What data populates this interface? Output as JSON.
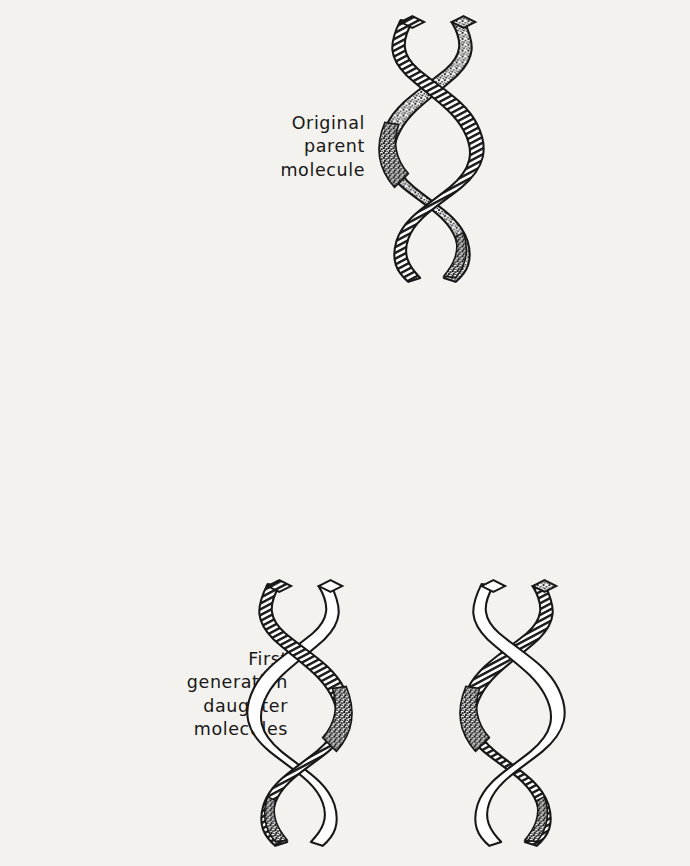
{
  "figure": {
    "background_color": "#f4f2ee",
    "ink_color": "#171717",
    "rows": [
      {
        "id": "parent",
        "label_lines": [
          "Original",
          "parent",
          "molecule"
        ],
        "molecule_count": 1
      },
      {
        "id": "first",
        "label_lines": [
          "First",
          "generation",
          "daughter",
          "molecules"
        ],
        "molecule_count": 2
      },
      {
        "id": "second",
        "label_lines": [
          "Second",
          "generation",
          "daughter",
          "molecules"
        ],
        "molecule_count": 4
      }
    ]
  },
  "labels": {
    "parent": {
      "l1": "Original",
      "l2": "parent",
      "l3": "molecule",
      "l4": ""
    },
    "first": {
      "l1": "First",
      "l2": "generation",
      "l3": "daughter",
      "l4": "molecules"
    },
    "second": {
      "l1": "Second",
      "l2": "generation",
      "l3": "daughter",
      "l4": "molecules"
    }
  },
  "strand_styles": {
    "hatched": "old parental strand, diagonal line shading",
    "stippled": "old parental strand, stippled shading",
    "blank": "newly synthesized strand, unshaded white"
  },
  "molecules": [
    {
      "id": "parent",
      "generation": "original",
      "strand_a": "hatched",
      "strand_b": "stippled"
    },
    {
      "id": "first-1",
      "generation": "first",
      "strand_a": "hatched",
      "strand_b": "blank"
    },
    {
      "id": "first-2",
      "generation": "first",
      "strand_a": "hatched",
      "strand_b": "blank"
    },
    {
      "id": "second-1",
      "generation": "second",
      "strand_a": "hatched",
      "strand_b": "blank"
    },
    {
      "id": "second-2",
      "generation": "second",
      "strand_a": "blank",
      "strand_b": "blank"
    },
    {
      "id": "second-3",
      "generation": "second",
      "strand_a": "blank",
      "strand_b": "blank"
    },
    {
      "id": "second-4",
      "generation": "second",
      "strand_a": "hatched",
      "strand_b": "blank"
    }
  ],
  "chart_data": {
    "type": "diagram",
    "generations": [
      "Original parent molecule",
      "First generation daughter molecules",
      "Second generation daughter molecules"
    ],
    "molecules_per_generation": [
      1,
      2,
      4
    ],
    "old_strands_per_generation": [
      2,
      2,
      2
    ],
    "new_strands_per_generation": [
      0,
      2,
      6
    ],
    "legend": [
      "hatched = old strand",
      "stippled = old strand",
      "blank = new strand"
    ]
  }
}
